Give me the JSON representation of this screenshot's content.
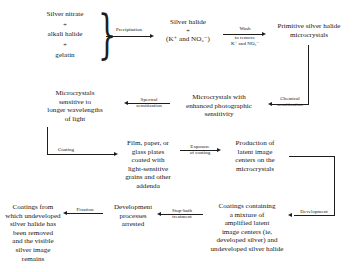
{
  "diagram": {
    "line_color": "#1d1d1d",
    "background": "#ffffff"
  },
  "nodes": {
    "ingredient_silver_nitrate": "Silver nitrate",
    "ingredient_plus_1": "+",
    "ingredient_alkali_halide": "alkali halide",
    "ingredient_plus_2": "+",
    "ingredient_gelatin": "gelatin",
    "silver_halide_products": "Silver halide\n+\n(K⁺ and NO₃⁻)",
    "primitive_microcrystals": "Primitive silver halide\nmicrocrystals",
    "enhanced_microcrystals": "Microcrystals with\nenhanced photographic\nsensitivity",
    "spectral_microcrystals": "Microcrystals\nsensitive to\nlonger wavelengths\nof light",
    "coated_plates": "Film, paper, or\nglass plates\ncoated with\nlight-sensitive\ngrains and other\naddenda",
    "latent_image": "Production of\nlatent image\ncenters on the\nmicrocrystals",
    "developed_coatings": "Coatings containing\na mixture of\namplified latent\nimage centers (ie,\ndeveloped silver) and\nundeveloped silver halide",
    "development_arrested": "Development\nprocesses\narrested",
    "fixed_coatings": "Coatings from\nwhich undeveloped\nsilver halide has\nbeen removed\nand the visible\nsilver image remains"
  },
  "edge_labels": {
    "precipitation": "Precipitation",
    "wash_top": "Wash",
    "wash_bottom": "to remove\nK⁺ and NO₃⁻",
    "chemical_sensitization": "Chemical\nsensitization",
    "spectral_sensitization": "Spectral\nsensitization",
    "coating": "Coating",
    "exposure": "Exposure\nof coating",
    "development": "Development",
    "stop_bath": "Stop-bath\ntreatment",
    "fixation": "Fixation"
  }
}
